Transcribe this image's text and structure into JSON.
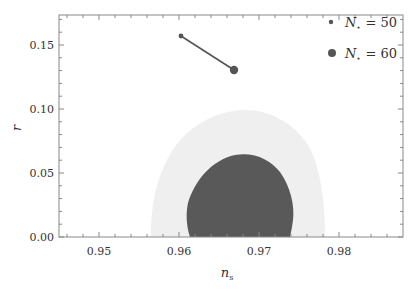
{
  "chart_data": {
    "type": "scatter",
    "title": "",
    "xlabel": "n_s",
    "ylabel": "r",
    "xlim": [
      0.945,
      0.988
    ],
    "ylim": [
      0.0,
      0.173
    ],
    "xticks": [
      0.95,
      0.96,
      0.97,
      0.98
    ],
    "xtick_labels": [
      "0.95",
      "0.96",
      "0.97",
      "0.98"
    ],
    "yticks": [
      0.0,
      0.05,
      0.1,
      0.15
    ],
    "ytick_labels": [
      "0.00",
      "0.05",
      "0.10",
      "0.15"
    ],
    "grid": false,
    "legend_position": "upper right",
    "contours": [
      {
        "name": "95% CL region",
        "color": "#efefef",
        "r_max": 0.099,
        "ns_range_at_r0": [
          0.9565,
          0.9781
        ]
      },
      {
        "name": "68% CL region",
        "color": "#595959",
        "r_max": 0.064,
        "ns_range_at_r0": [
          0.9619,
          0.9741
        ]
      }
    ],
    "series": [
      {
        "name": "N⋆ = 50",
        "marker": "small-dot",
        "x": [
          0.9603
        ],
        "y": [
          0.157
        ]
      },
      {
        "name": "N⋆ = 60",
        "marker": "large-dot",
        "x": [
          0.9669
        ],
        "y": [
          0.13
        ]
      }
    ],
    "lines": [
      {
        "from": [
          0.9603,
          0.157
        ],
        "to": [
          0.9669,
          0.13
        ],
        "color": "#555555"
      }
    ]
  },
  "axes": {
    "xlabel_main": "n",
    "xlabel_sub": "s",
    "ylabel": "r"
  },
  "legend": {
    "items": [
      {
        "label_main": "N",
        "label_sub": "⋆",
        "label_rest": " = 50"
      },
      {
        "label_main": "N",
        "label_sub": "⋆",
        "label_rest": " = 60"
      }
    ]
  },
  "colors": {
    "dark_region": "#595959",
    "light_region": "#efefef",
    "marker": "#555555",
    "frame": "#888888"
  }
}
